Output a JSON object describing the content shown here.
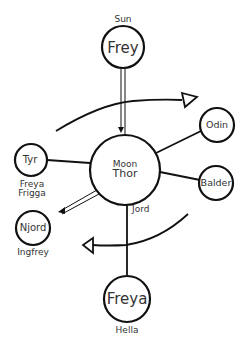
{
  "diagram": {
    "colors": {
      "stroke": "#111111",
      "text": "#333333",
      "background": "#ffffff"
    },
    "nodes": {
      "frey": {
        "label": "Frey",
        "caption_above": "Sun"
      },
      "thor": {
        "label": "Thor",
        "caption_above": "Moon"
      },
      "tyr": {
        "label": "Tyr",
        "caption_below_1": "Freya",
        "caption_below_2": "Frigga"
      },
      "odin": {
        "label": "Odin"
      },
      "balder": {
        "label": "Balder"
      },
      "njord": {
        "label": "Njord",
        "caption_below": "Ingfrey"
      },
      "freya": {
        "label": "Freya",
        "caption_below": "Hella"
      }
    },
    "edges": [
      {
        "from": "frey",
        "to": "thor",
        "style": "double-arrow"
      },
      {
        "from": "thor",
        "to": "tyr",
        "style": "line"
      },
      {
        "from": "thor",
        "to": "odin",
        "style": "line"
      },
      {
        "from": "thor",
        "to": "balder",
        "style": "line"
      },
      {
        "from": "thor",
        "to": "njord",
        "style": "double-arrow"
      },
      {
        "from": "thor",
        "to": "freya",
        "style": "line",
        "label": "Jord"
      }
    ],
    "rotation_arrows": [
      {
        "name": "top-arc",
        "direction": "right",
        "arrowhead": "hollow-triangle"
      },
      {
        "name": "bottom-arc",
        "direction": "left",
        "arrowhead": "hollow-triangle"
      }
    ]
  }
}
